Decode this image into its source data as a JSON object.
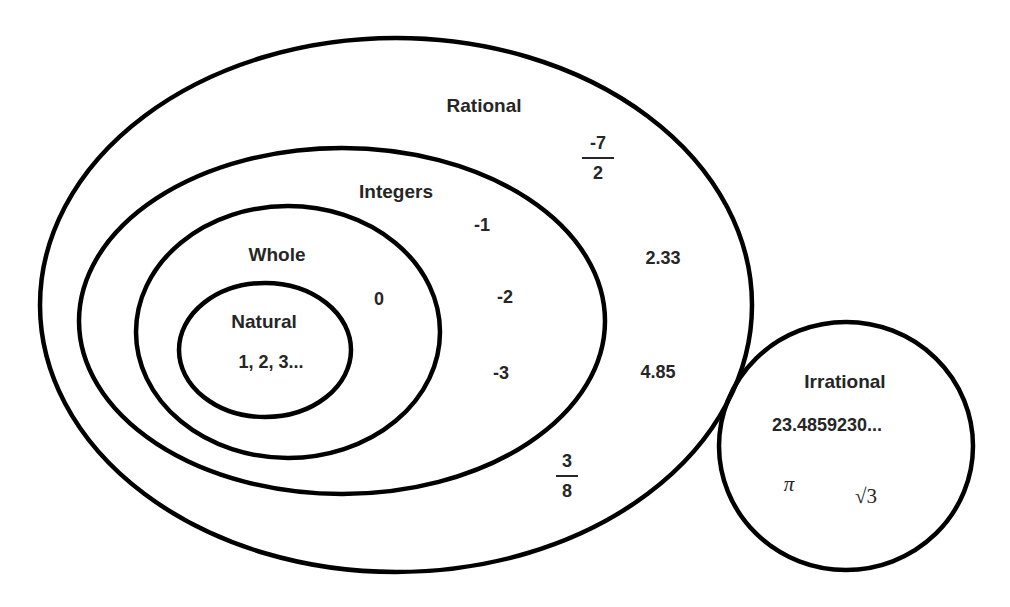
{
  "diagram": {
    "type": "venn-nested",
    "stroke_color": "#000000",
    "text_color": "#262626",
    "background": "#ffffff",
    "sets": {
      "rational": {
        "label": "Rational",
        "members": {
          "frac1": {
            "numerator": "-7",
            "denominator": "2"
          },
          "dec1": "2.33",
          "dec2": "4.85",
          "frac2": {
            "numerator": "3",
            "denominator": "8"
          }
        }
      },
      "integers": {
        "label": "Integers",
        "members": [
          "-1",
          "-2",
          "-3"
        ]
      },
      "whole": {
        "label": "Whole",
        "members": [
          "0"
        ]
      },
      "natural": {
        "label": "Natural",
        "members_text": "1, 2, 3..."
      },
      "irrational": {
        "label": "Irrational",
        "members": {
          "decimal": "23.4859230...",
          "pi": "π",
          "sqrt3": "√3"
        }
      }
    }
  }
}
